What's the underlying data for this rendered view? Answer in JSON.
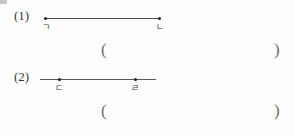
{
  "page": {
    "kind": "worksheet-figure",
    "background_color": "#fdfdfd",
    "ink_color": "#3a3a3a"
  },
  "problems": [
    {
      "number": "(1)",
      "figure": {
        "type": "segment-with-endpoints",
        "line": {
          "x_start": 44,
          "x_end": 161
        },
        "points": [
          {
            "label": "ㄱ",
            "x": 45
          },
          {
            "label": "ㄴ",
            "x": 159
          }
        ]
      },
      "answer": {
        "open_paren": "(",
        "close_paren": ")",
        "value": ""
      }
    },
    {
      "number": "(2)",
      "figure": {
        "type": "line-with-interior-points",
        "line": {
          "x_start": 40,
          "x_end": 156
        },
        "points": [
          {
            "label": "ㄷ",
            "x": 59
          },
          {
            "label": "ㄹ",
            "x": 135
          }
        ]
      },
      "answer": {
        "open_paren": "(",
        "close_paren": ")",
        "value": ""
      }
    }
  ]
}
